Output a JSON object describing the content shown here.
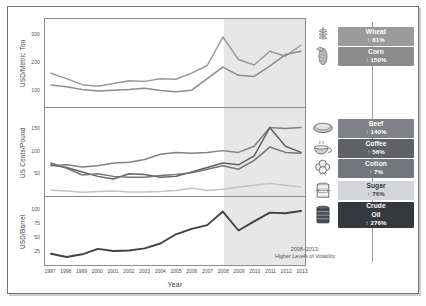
{
  "chart_data": {
    "type": "line",
    "title": "",
    "xlabel": "Year",
    "x": [
      1997,
      1998,
      1999,
      2000,
      2001,
      2002,
      2003,
      2004,
      2005,
      2006,
      2007,
      2008,
      2009,
      2010,
      2011,
      2012,
      2013
    ],
    "xticks": [
      "1997",
      "1998",
      "1999",
      "2000",
      "2001",
      "2002",
      "2003",
      "2004",
      "2005",
      "2006",
      "2007",
      "2008",
      "2009",
      "2010",
      "2011",
      "2012",
      "2013"
    ],
    "grid": false,
    "legend_position": "right",
    "annotation": {
      "line1": "2008–2013:",
      "line2": "Higher Levels of Volatility",
      "shaded_from": 2008,
      "shaded_to": 2013
    },
    "panels": [
      {
        "id": "panel-top",
        "ylabel": "USD/Metric Ton",
        "ylim": [
          40,
          340
        ],
        "yticks": [
          100,
          200,
          300
        ],
        "ytick_labels": [
          "100",
          "200",
          "300"
        ],
        "series": [
          {
            "name": "Wheat",
            "color": "#9a9a9a",
            "values": [
              160,
              140,
              118,
              112,
              122,
              132,
              130,
              140,
              138,
              160,
              188,
              292,
              210,
              190,
              240,
              222,
              262
            ]
          },
          {
            "name": "Corn",
            "color": "#8c8c8c",
            "values": [
              117,
              110,
              100,
              95,
              98,
              100,
              105,
              97,
              92,
              98,
              140,
              182,
              152,
              148,
              186,
              228,
              240
            ]
          }
        ]
      },
      {
        "id": "panel-mid",
        "ylabel": "US Cents/Pound",
        "ylim": [
          0,
          185
        ],
        "yticks": [
          50,
          100,
          150
        ],
        "ytick_labels": [
          "50",
          "100",
          "150"
        ],
        "series": [
          {
            "name": "Beef",
            "color": "#7e8186",
            "values": [
              66,
              68,
              63,
              66,
              72,
              74,
              80,
              92,
              96,
              94,
              96,
              100,
              96,
              110,
              152,
              150,
              152
            ]
          },
          {
            "name": "Coffee",
            "color": "#5f6166",
            "values": [
              68,
              62,
              52,
              42,
              36,
              48,
              46,
              40,
              42,
              52,
              62,
              72,
              68,
              88,
              152,
              110,
              96
            ]
          },
          {
            "name": "Cotton",
            "color": "#73767b",
            "values": [
              72,
              60,
              45,
              48,
              42,
              40,
              40,
              44,
              46,
              50,
              58,
              66,
              58,
              78,
              108,
              96,
              94
            ]
          },
          {
            "name": "Sugar",
            "color": "#c2c4c7",
            "values": [
              11,
              9,
              6,
              8,
              9,
              7,
              7,
              8,
              10,
              15,
              10,
              13,
              18,
              22,
              26,
              22,
              18
            ]
          }
        ]
      },
      {
        "id": "panel-bot",
        "ylabel": "USD/Barrel",
        "ylim": [
          0,
          115
        ],
        "yticks": [
          25,
          50,
          75,
          100
        ],
        "ytick_labels": [
          "100",
          "75",
          "50",
          "25"
        ],
        "series": [
          {
            "name": "Crude Oil",
            "color": "#3f4247",
            "values": [
              19,
              13,
              18,
              28,
              24,
              25,
              29,
              38,
              55,
              65,
              72,
              97,
              62,
              79,
              95,
              94,
              98
            ]
          }
        ]
      }
    ]
  },
  "legend": {
    "items": [
      {
        "name": "Wheat",
        "percent": "81%",
        "icon": "wheat-icon",
        "color": "#9a9a9a",
        "text": "light",
        "group": "grains"
      },
      {
        "name": "Corn",
        "percent": "150%",
        "icon": "corn-icon",
        "color": "#8c8c8c",
        "text": "light",
        "group": "grains"
      },
      {
        "name": "Beef",
        "percent": "140%",
        "icon": "beef-icon",
        "color": "#7e8186",
        "text": "light",
        "group": "softs"
      },
      {
        "name": "Coffee",
        "percent": "56%",
        "icon": "coffee-icon",
        "color": "#5f6166",
        "text": "light",
        "group": "softs"
      },
      {
        "name": "Cotton",
        "percent": "7%",
        "icon": "cotton-icon",
        "color": "#73767b",
        "text": "light",
        "group": "softs"
      },
      {
        "name": "Sugar",
        "percent": "76%",
        "icon": "sugar-icon",
        "color": "#d3d5d8",
        "text": "dark",
        "group": "softs"
      },
      {
        "name": "Crude Oil",
        "percent": "276%",
        "icon": "oil-barrel-icon",
        "color": "#35383d",
        "text": "light",
        "group": "energy"
      }
    ],
    "arrow": "↑"
  }
}
